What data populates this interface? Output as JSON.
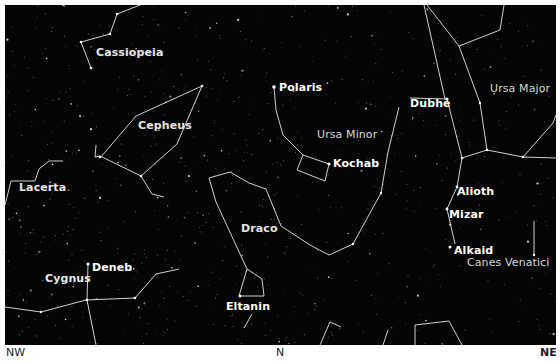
{
  "map": {
    "background": "#050505",
    "line_color": "#e8e8e8",
    "constellations": [
      {
        "name": "Cassiopeia",
        "x": 91,
        "y": 47
      },
      {
        "name": "Cepheus",
        "x": 133,
        "y": 120
      },
      {
        "name": "Lacerta",
        "x": 14,
        "y": 182
      },
      {
        "name": "Cygnus",
        "x": 42,
        "y": 273
      },
      {
        "name": "Draco",
        "x": 238,
        "y": 223
      },
      {
        "name": "Ursa Minor",
        "x": 310,
        "y": 128
      },
      {
        "name": "Ursa Major",
        "x": 488,
        "y": 82
      },
      {
        "name": "Canes Venatici",
        "x": 466,
        "y": 257
      }
    ],
    "stars": [
      {
        "name": "Polaris",
        "x": 280,
        "y": 87
      },
      {
        "name": "Kochab",
        "x": 334,
        "y": 157
      },
      {
        "name": "Dubhe",
        "x": 410,
        "y": 98
      },
      {
        "name": "Alioth",
        "x": 457,
        "y": 187
      },
      {
        "name": "Mizar",
        "x": 447,
        "y": 209
      },
      {
        "name": "Alkaid",
        "x": 455,
        "y": 244
      },
      {
        "name": "Deneb",
        "x": 92,
        "y": 263
      },
      {
        "name": "Eltanin",
        "x": 226,
        "y": 301
      }
    ]
  },
  "directions": {
    "left": "NW",
    "center": "N",
    "right": "NE"
  }
}
